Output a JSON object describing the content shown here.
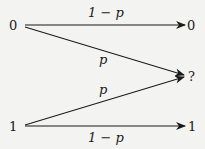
{
  "diagram": {
    "inputs": [
      {
        "id": "in0",
        "label": "0"
      },
      {
        "id": "in1",
        "label": "1"
      }
    ],
    "outputs": [
      {
        "id": "out0",
        "label": "0"
      },
      {
        "id": "outE",
        "label": "?"
      },
      {
        "id": "out1",
        "label": "1"
      }
    ],
    "edges": [
      {
        "from": "in0",
        "to": "out0",
        "label": "1 − p"
      },
      {
        "from": "in0",
        "to": "outE",
        "label": "p"
      },
      {
        "from": "in1",
        "to": "outE",
        "label": "p"
      },
      {
        "from": "in1",
        "to": "out1",
        "label": "1 − p"
      }
    ],
    "colors": {
      "stroke": "#1a1a1a",
      "background": "#f3f3f1"
    }
  }
}
